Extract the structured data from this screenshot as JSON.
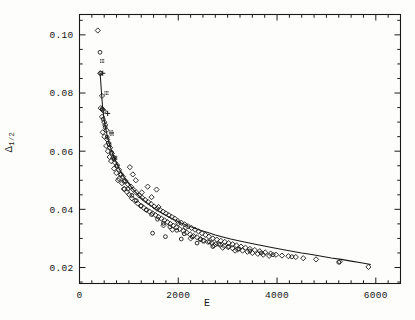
{
  "figure": {
    "title": "",
    "xlabel": "E",
    "ylabel_main": "Δ",
    "ylabel_sub": "1/2"
  },
  "chart_data": {
    "type": "scatter",
    "title": "",
    "xlabel": "E",
    "ylabel": "Δ_1/2",
    "xlim": [
      0,
      6500
    ],
    "ylim": [
      0.0145,
      0.107
    ],
    "grid": false,
    "legend": null,
    "xticks_major": [
      0,
      2000,
      4000,
      6000
    ],
    "xtick_labels": [
      "0",
      "2000",
      "4000",
      "6000"
    ],
    "xticks_minor_step": 250,
    "yticks_major": [
      0.02,
      0.04,
      0.06,
      0.08,
      0.1
    ],
    "ytick_labels": [
      "0.02",
      "0.04",
      "0.06",
      "0.08",
      "0.10"
    ],
    "yticks_minor_step": 0.005,
    "series": [
      {
        "name": "diamonds",
        "marker": "diamond",
        "points": [
          [
            370,
            0.1015
          ],
          [
            420,
            0.0868
          ],
          [
            455,
            0.079
          ],
          [
            430,
            0.0748
          ],
          [
            470,
            0.0742
          ],
          [
            495,
            0.0738
          ],
          [
            455,
            0.0718
          ],
          [
            500,
            0.07
          ],
          [
            520,
            0.069
          ],
          [
            470,
            0.0665
          ],
          [
            545,
            0.0672
          ],
          [
            505,
            0.065
          ],
          [
            560,
            0.064
          ],
          [
            590,
            0.0628
          ],
          [
            540,
            0.0618
          ],
          [
            620,
            0.0612
          ],
          [
            575,
            0.06
          ],
          [
            655,
            0.0592
          ],
          [
            610,
            0.058
          ],
          [
            690,
            0.0578
          ],
          [
            640,
            0.0566
          ],
          [
            720,
            0.056
          ],
          [
            760,
            0.0552
          ],
          [
            700,
            0.054
          ],
          [
            800,
            0.0536
          ],
          [
            745,
            0.0525
          ],
          [
            845,
            0.052
          ],
          [
            880,
            0.0512
          ],
          [
            800,
            0.0505
          ],
          [
            930,
            0.0498
          ],
          [
            860,
            0.049
          ],
          [
            980,
            0.0486
          ],
          [
            1040,
            0.0478
          ],
          [
            910,
            0.047
          ],
          [
            1090,
            0.0468
          ],
          [
            960,
            0.046
          ],
          [
            1150,
            0.0458
          ],
          [
            1010,
            0.045
          ],
          [
            1210,
            0.0448
          ],
          [
            1270,
            0.044
          ],
          [
            1060,
            0.0438
          ],
          [
            1330,
            0.0432
          ],
          [
            1120,
            0.043
          ],
          [
            1390,
            0.0425
          ],
          [
            1180,
            0.042
          ],
          [
            1450,
            0.0418
          ],
          [
            1240,
            0.0412
          ],
          [
            1510,
            0.041
          ],
          [
            1300,
            0.0405
          ],
          [
            1570,
            0.0402
          ],
          [
            1360,
            0.0398
          ],
          [
            1630,
            0.0398
          ],
          [
            1420,
            0.0392
          ],
          [
            1690,
            0.0392
          ],
          [
            1480,
            0.0386
          ],
          [
            1750,
            0.0386
          ],
          [
            1540,
            0.038
          ],
          [
            1810,
            0.038
          ],
          [
            1600,
            0.0374
          ],
          [
            1870,
            0.0374
          ],
          [
            1660,
            0.0368
          ],
          [
            1930,
            0.0368
          ],
          [
            1720,
            0.0362
          ],
          [
            1990,
            0.036
          ],
          [
            1780,
            0.0356
          ],
          [
            2060,
            0.0354
          ],
          [
            1840,
            0.035
          ],
          [
            2130,
            0.0348
          ],
          [
            1900,
            0.0344
          ],
          [
            2200,
            0.0342
          ],
          [
            1960,
            0.0338
          ],
          [
            2270,
            0.0336
          ],
          [
            2030,
            0.0332
          ],
          [
            2340,
            0.033
          ],
          [
            2100,
            0.0326
          ],
          [
            2410,
            0.0324
          ],
          [
            2170,
            0.032
          ],
          [
            2480,
            0.0318
          ],
          [
            2240,
            0.0314
          ],
          [
            2550,
            0.0312
          ],
          [
            2310,
            0.0308
          ],
          [
            2620,
            0.0306
          ],
          [
            2380,
            0.0304
          ],
          [
            2700,
            0.03
          ],
          [
            2450,
            0.0298
          ],
          [
            2780,
            0.0296
          ],
          [
            2520,
            0.0292
          ],
          [
            2860,
            0.0292
          ],
          [
            2600,
            0.0288
          ],
          [
            2940,
            0.0288
          ],
          [
            2680,
            0.0284
          ],
          [
            3020,
            0.0284
          ],
          [
            2760,
            0.028
          ],
          [
            3100,
            0.028
          ],
          [
            2850,
            0.0278
          ],
          [
            3180,
            0.0276
          ],
          [
            2930,
            0.0274
          ],
          [
            3270,
            0.0272
          ],
          [
            3010,
            0.027
          ],
          [
            3360,
            0.0268
          ],
          [
            3100,
            0.0266
          ],
          [
            3450,
            0.0264
          ],
          [
            3200,
            0.0262
          ],
          [
            3550,
            0.026
          ],
          [
            3300,
            0.0258
          ],
          [
            3650,
            0.0256
          ],
          [
            3400,
            0.0254
          ],
          [
            3760,
            0.0252
          ],
          [
            3500,
            0.025
          ],
          [
            3870,
            0.0248
          ],
          [
            3610,
            0.0247
          ],
          [
            3980,
            0.0244
          ],
          [
            3720,
            0.0244
          ],
          [
            4100,
            0.0241
          ],
          [
            3840,
            0.024
          ],
          [
            4230,
            0.0239
          ],
          [
            4380,
            0.0236
          ],
          [
            4530,
            0.0232
          ],
          [
            4790,
            0.0228
          ],
          [
            5270,
            0.022
          ],
          [
            5850,
            0.0202
          ],
          [
            780,
            0.05
          ],
          [
            900,
            0.047
          ],
          [
            1140,
            0.05
          ],
          [
            1260,
            0.0458
          ],
          [
            1020,
            0.0545
          ],
          [
            1080,
            0.052
          ],
          [
            1600,
            0.0408
          ],
          [
            1700,
            0.0345
          ],
          [
            2000,
            0.0352
          ],
          [
            2250,
            0.03
          ],
          [
            2500,
            0.0292
          ],
          [
            2900,
            0.0268
          ],
          [
            1380,
            0.0478
          ],
          [
            1460,
            0.0442
          ],
          [
            1560,
            0.0468
          ],
          [
            1880,
            0.033
          ],
          [
            2150,
            0.0338
          ],
          [
            2720,
            0.0276
          ],
          [
            3150,
            0.0258
          ]
        ]
      },
      {
        "name": "circles",
        "marker": "circle",
        "points": [
          [
            415,
            0.094
          ],
          [
            430,
            0.0868
          ],
          [
            460,
            0.0745
          ],
          [
            480,
            0.071
          ],
          [
            520,
            0.0682
          ],
          [
            560,
            0.0648
          ],
          [
            600,
            0.0622
          ],
          [
            650,
            0.0596
          ],
          [
            700,
            0.0572
          ],
          [
            760,
            0.0548
          ],
          [
            830,
            0.052
          ],
          [
            900,
            0.0496
          ],
          [
            980,
            0.047
          ],
          [
            1060,
            0.0448
          ],
          [
            1150,
            0.043
          ],
          [
            1250,
            0.0412
          ],
          [
            1350,
            0.0398
          ],
          [
            1460,
            0.0382
          ],
          [
            1580,
            0.0366
          ],
          [
            1700,
            0.0352
          ],
          [
            1830,
            0.034
          ],
          [
            1970,
            0.0328
          ],
          [
            2120,
            0.0316
          ],
          [
            2280,
            0.0306
          ],
          [
            2450,
            0.0296
          ],
          [
            2630,
            0.0288
          ],
          [
            2820,
            0.028
          ],
          [
            3020,
            0.0272
          ],
          [
            3230,
            0.0264
          ],
          [
            3450,
            0.0257
          ],
          [
            3680,
            0.025
          ],
          [
            3920,
            0.0244
          ],
          [
            4300,
            0.0237
          ],
          [
            5250,
            0.0218
          ],
          [
            1480,
            0.0318
          ],
          [
            1740,
            0.0306
          ],
          [
            2060,
            0.0298
          ],
          [
            2380,
            0.0284
          ],
          [
            2700,
            0.0272
          ]
        ]
      },
      {
        "name": "plus",
        "marker": "plus",
        "points": [
          [
            470,
            0.0868
          ],
          [
            570,
            0.073
          ]
        ]
      },
      {
        "name": "hatched-squares",
        "marker": "hatched-square",
        "points": [
          [
            460,
            0.091
          ],
          [
            545,
            0.08
          ],
          [
            640,
            0.0665
          ],
          [
            655,
            0.066
          ],
          [
            710,
            0.0578
          ],
          [
            725,
            0.0576
          ]
        ]
      }
    ],
    "fit_curve": {
      "name": "fitted-curve",
      "points": [
        [
          418,
          0.0868
        ],
        [
          450,
          0.079
        ],
        [
          470,
          0.0748
        ],
        [
          495,
          0.0712
        ],
        [
          520,
          0.0688
        ],
        [
          550,
          0.0662
        ],
        [
          580,
          0.064
        ],
        [
          620,
          0.0616
        ],
        [
          660,
          0.0596
        ],
        [
          700,
          0.0578
        ],
        [
          750,
          0.0558
        ],
        [
          800,
          0.054
        ],
        [
          860,
          0.0522
        ],
        [
          920,
          0.0506
        ],
        [
          990,
          0.049
        ],
        [
          1060,
          0.0474
        ],
        [
          1140,
          0.0458
        ],
        [
          1220,
          0.0444
        ],
        [
          1310,
          0.043
        ],
        [
          1400,
          0.0418
        ],
        [
          1500,
          0.0406
        ],
        [
          1600,
          0.0394
        ],
        [
          1710,
          0.0383
        ],
        [
          1820,
          0.0373
        ],
        [
          1940,
          0.0363
        ],
        [
          2060,
          0.0353
        ],
        [
          2190,
          0.0344
        ],
        [
          2320,
          0.0336
        ],
        [
          2460,
          0.0327
        ],
        [
          2600,
          0.032
        ],
        [
          2750,
          0.0312
        ],
        [
          2900,
          0.0305
        ],
        [
          3060,
          0.0298
        ],
        [
          3220,
          0.0292
        ],
        [
          3390,
          0.0286
        ],
        [
          3560,
          0.028
        ],
        [
          3740,
          0.0274
        ],
        [
          3920,
          0.0268
        ],
        [
          4110,
          0.0262
        ],
        [
          4300,
          0.0256
        ],
        [
          4500,
          0.025
        ],
        [
          4700,
          0.0245
        ],
        [
          4900,
          0.0239
        ],
        [
          5100,
          0.0233
        ],
        [
          5300,
          0.0228
        ],
        [
          5500,
          0.0222
        ],
        [
          5700,
          0.0216
        ],
        [
          5900,
          0.021
        ]
      ]
    }
  }
}
